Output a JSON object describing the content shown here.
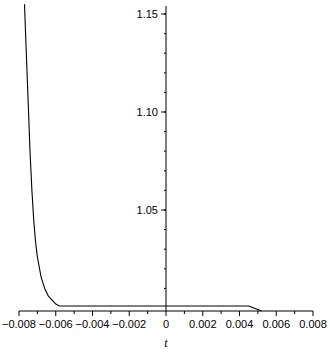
{
  "chart_data": {
    "type": "line",
    "title": "",
    "xlabel": "t",
    "ylabel": "",
    "xlim": [
      -0.008,
      0.008
    ],
    "ylim": [
      1.0,
      1.15
    ],
    "grid": false,
    "legend": null,
    "x_ticks": [
      "−0.008",
      "−0.006",
      "−0.004",
      "−0.002",
      "0",
      "0.002",
      "0.004",
      "0.006",
      "0.008"
    ],
    "x_tick_values": [
      -0.008,
      -0.006,
      -0.004,
      -0.002,
      0,
      0.002,
      0.004,
      0.006,
      0.008
    ],
    "y_ticks": [
      "1.05",
      "1.10",
      "1.15"
    ],
    "y_tick_values": [
      1.05,
      1.1,
      1.15
    ],
    "series": [
      {
        "name": "curve",
        "color": "#000000",
        "x": [
          -0.0077,
          -0.0076,
          -0.0075,
          -0.0074,
          -0.0073,
          -0.0072,
          -0.0071,
          -0.007,
          -0.0068,
          -0.0066,
          -0.0064,
          -0.0062,
          -0.006,
          -0.0058,
          -0.0055,
          -0.004,
          -0.002,
          0.0,
          0.002,
          0.0045,
          0.0052
        ],
        "y": [
          1.155,
          1.13,
          1.105,
          1.08,
          1.06,
          1.045,
          1.034,
          1.026,
          1.016,
          1.01,
          1.006,
          1.004,
          1.002,
          1.001,
          1.001,
          1.001,
          1.001,
          1.001,
          1.001,
          1.001,
          0.9985
        ]
      }
    ]
  }
}
